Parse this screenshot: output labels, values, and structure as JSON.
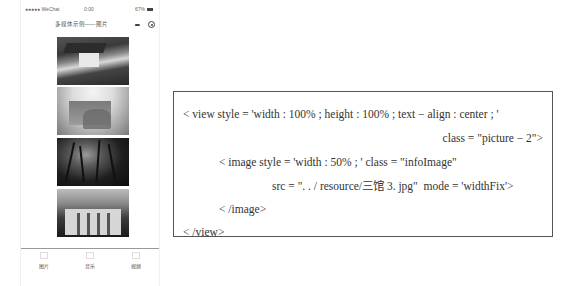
{
  "phone": {
    "status_bar": {
      "carrier": "●●●●● WeChat",
      "time": "0:00",
      "battery": "67%"
    },
    "nav_bar": {
      "title": "多媒体示例——图片",
      "more_icon": "•••",
      "close_icon": "target-circle-icon"
    },
    "images": [
      {
        "name": "campus-house-photo",
        "tone": "dark-roof-white-house"
      },
      {
        "name": "building-in-trees-photo",
        "tone": "light-misty"
      },
      {
        "name": "tall-trees-photo",
        "tone": "dark-silhouette"
      },
      {
        "name": "library-facade-photo",
        "tone": "columned-building"
      }
    ],
    "tab_bar": {
      "tabs": [
        {
          "label": "图片",
          "icon": "image-icon"
        },
        {
          "label": "音乐",
          "icon": "music-icon"
        },
        {
          "label": "视频",
          "icon": "video-icon"
        }
      ]
    }
  },
  "code": {
    "lines": [
      "< view style = 'width : 100% ; height : 100% ; text − align : center ; '",
      "class = \"picture − 2\">",
      "< image style = 'width : 50% ; ' class = \"infoImage\"",
      "src = \". . / resource/三馆 3. jpg\"  mode = 'widthFix'>",
      "< /image>",
      "< /view>"
    ]
  }
}
